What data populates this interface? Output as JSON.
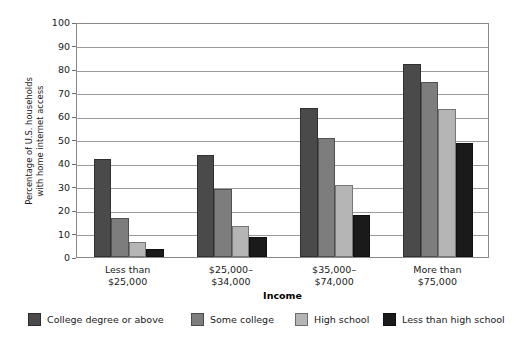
{
  "chart_data": {
    "type": "bar",
    "title": "",
    "subtitle": "",
    "xlabel": "Income",
    "ylabel_line1": "Percentage of U.S. households",
    "ylabel_line2": "with home internet access",
    "categories": [
      {
        "line1": "Less than",
        "line2": "$25,000"
      },
      {
        "line1": "$25,000–",
        "line2": "$34,000"
      },
      {
        "line1": "$35,000–",
        "line2": "$74,000"
      },
      {
        "line1": "More than",
        "line2": "$75,000"
      }
    ],
    "series": [
      {
        "name": "College degree or above",
        "color": "#4a4a4a",
        "values": [
          41.5,
          43.5,
          63.5,
          82.0
        ]
      },
      {
        "name": "Some college",
        "color": "#7d7d7d",
        "values": [
          16.5,
          29.0,
          50.5,
          74.5
        ]
      },
      {
        "name": "High school",
        "color": "#b5b5b5",
        "values": [
          6.5,
          13.0,
          30.5,
          63.0
        ]
      },
      {
        "name": "Less than high school",
        "color": "#1a1a1a",
        "values": [
          3.5,
          8.5,
          18.0,
          48.5
        ]
      }
    ],
    "yticks": [
      0,
      10,
      20,
      30,
      40,
      50,
      60,
      70,
      80,
      90,
      100
    ],
    "ylim": [
      0,
      100
    ],
    "grid": true,
    "legend_position": "bottom",
    "axis_color": "#8a8a8a",
    "grid_color": "#9a9a9a"
  }
}
